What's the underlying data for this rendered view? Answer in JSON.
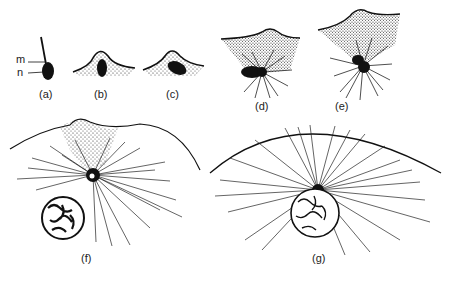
{
  "figure": {
    "panels": [
      {
        "id": "a",
        "label": "(a)",
        "x": 37,
        "y": 92
      },
      {
        "id": "b",
        "label": "(b)",
        "x": 92,
        "y": 92
      },
      {
        "id": "c",
        "label": "(c)",
        "x": 166,
        "y": 92
      },
      {
        "id": "d",
        "label": "(d)",
        "x": 254,
        "y": 98
      },
      {
        "id": "e",
        "label": "(e)",
        "x": 335,
        "y": 98
      },
      {
        "id": "f",
        "label": "(f)",
        "x": 80,
        "y": 253
      },
      {
        "id": "g",
        "label": "(g)",
        "x": 314,
        "y": 253
      }
    ],
    "annotations": [
      {
        "id": "m",
        "label": "m",
        "x": 18,
        "y": 56
      },
      {
        "id": "n",
        "label": "n",
        "x": 18,
        "y": 67
      }
    ]
  }
}
